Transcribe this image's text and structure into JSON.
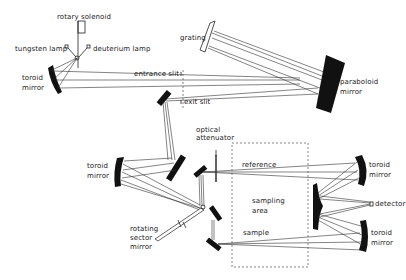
{
  "diagram": {
    "type": "optical-schematic",
    "labels": {
      "rotary_solenoid": "rotary solenoid",
      "tungsten_lamp": "tungsten lamp",
      "deuterium_lamp": "deuterium lamp",
      "toroid_mirror_source_1": "toroid",
      "toroid_mirror_source_2": "mirror",
      "grating": "grating",
      "entrance_slit": "entrance slit",
      "exit_slit": "exit slit",
      "paraboloid_mirror_1": "paraboloid",
      "paraboloid_mirror_2": "mirror",
      "optical_attenuator_1": "optical",
      "optical_attenuator_2": "attenuator",
      "toroid_mirror_left_1": "toroid",
      "toroid_mirror_left_2": "mirror",
      "reference": "reference",
      "sampling_area_1": "sampling",
      "sampling_area_2": "area",
      "sample": "sample",
      "rotating_sector_mirror_1": "rotating",
      "rotating_sector_mirror_2": "sector",
      "rotating_sector_mirror_3": "mirror",
      "toroid_mirror_top_right_1": "toroid",
      "toroid_mirror_top_right_2": "mirror",
      "detector": "detector",
      "toroid_mirror_bottom_right_1": "toroid",
      "toroid_mirror_bottom_right_2": "mirror"
    },
    "colors": {
      "ink": "#111111",
      "background": "#ffffff"
    }
  }
}
